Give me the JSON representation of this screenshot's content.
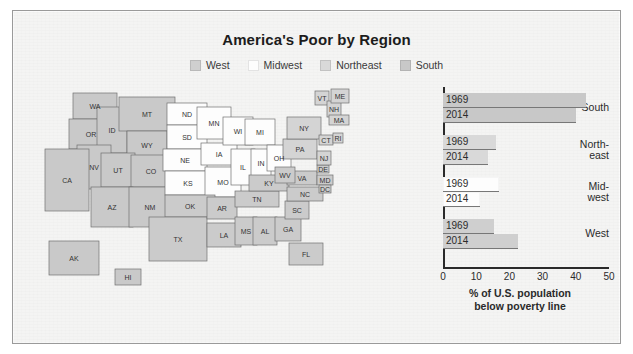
{
  "figure": {
    "title": "America's Poor by Region",
    "frame_color": "#9a9a9a",
    "background": "#f4f4f3"
  },
  "legend": {
    "position": "top-center",
    "items": [
      {
        "label": "West",
        "swatch": "#cfcfcf"
      },
      {
        "label": "Midwest",
        "swatch": "#fdfdfd"
      },
      {
        "label": "Northeast",
        "swatch": "#d9d9d9"
      },
      {
        "label": "South",
        "swatch": "#c8c8c8"
      }
    ]
  },
  "map": {
    "name": "united-states-choropleth",
    "region_colors": {
      "West": "#c9c9c9",
      "Midwest": "#fdfdfd",
      "Northeast": "#d4d4d4",
      "South": "#cbcbcb"
    },
    "ocean": "#f2f2f1",
    "border": "#6f6f6f",
    "states": [
      {
        "abbr": "WA",
        "region": "West",
        "x": 60,
        "y": 22
      },
      {
        "abbr": "OR",
        "region": "West",
        "x": 46,
        "y": 46
      },
      {
        "abbr": "ID",
        "region": "West",
        "x": 80,
        "y": 48
      },
      {
        "abbr": "MT",
        "region": "West",
        "x": 110,
        "y": 27
      },
      {
        "abbr": "WY",
        "region": "West",
        "x": 113,
        "y": 57
      },
      {
        "abbr": "NV",
        "region": "West",
        "x": 55,
        "y": 78
      },
      {
        "abbr": "UT",
        "region": "West",
        "x": 85,
        "y": 82
      },
      {
        "abbr": "CO",
        "region": "West",
        "x": 120,
        "y": 87
      },
      {
        "abbr": "CA",
        "region": "West",
        "x": 30,
        "y": 95
      },
      {
        "abbr": "AZ",
        "region": "West",
        "x": 76,
        "y": 118
      },
      {
        "abbr": "NM",
        "region": "West",
        "x": 113,
        "y": 119
      },
      {
        "abbr": "AK",
        "region": "West",
        "x": 38,
        "y": 175
      },
      {
        "abbr": "HI",
        "region": "West",
        "x": 96,
        "y": 196
      },
      {
        "abbr": "ND",
        "region": "Midwest",
        "x": 153,
        "y": 30
      },
      {
        "abbr": "SD",
        "region": "Midwest",
        "x": 153,
        "y": 52
      },
      {
        "abbr": "NE",
        "region": "Midwest",
        "x": 152,
        "y": 76
      },
      {
        "abbr": "KS",
        "region": "Midwest",
        "x": 155,
        "y": 98
      },
      {
        "abbr": "MN",
        "region": "Midwest",
        "x": 181,
        "y": 38
      },
      {
        "abbr": "IA",
        "region": "Midwest",
        "x": 184,
        "y": 70
      },
      {
        "abbr": "MO",
        "region": "Midwest",
        "x": 190,
        "y": 97
      },
      {
        "abbr": "WI",
        "region": "Midwest",
        "x": 206,
        "y": 48
      },
      {
        "abbr": "IL",
        "region": "Midwest",
        "x": 209,
        "y": 82
      },
      {
        "abbr": "IN",
        "region": "Midwest",
        "x": 228,
        "y": 80
      },
      {
        "abbr": "MI",
        "region": "Midwest",
        "x": 228,
        "y": 52
      },
      {
        "abbr": "OH",
        "region": "Midwest",
        "x": 246,
        "y": 74
      },
      {
        "abbr": "OK",
        "region": "South",
        "x": 157,
        "y": 122
      },
      {
        "abbr": "TX",
        "region": "South",
        "x": 145,
        "y": 152
      },
      {
        "abbr": "AR",
        "region": "South",
        "x": 190,
        "y": 124
      },
      {
        "abbr": "LA",
        "region": "South",
        "x": 192,
        "y": 152
      },
      {
        "abbr": "MS",
        "region": "South",
        "x": 213,
        "y": 143
      },
      {
        "abbr": "AL",
        "region": "South",
        "x": 232,
        "y": 143
      },
      {
        "abbr": "TN",
        "region": "South",
        "x": 224,
        "y": 116
      },
      {
        "abbr": "KY",
        "region": "South",
        "x": 235,
        "y": 100
      },
      {
        "abbr": "GA",
        "region": "South",
        "x": 252,
        "y": 143
      },
      {
        "abbr": "FL",
        "region": "South",
        "x": 272,
        "y": 170
      },
      {
        "abbr": "SC",
        "region": "South",
        "x": 265,
        "y": 127
      },
      {
        "abbr": "NC",
        "region": "South",
        "x": 271,
        "y": 112
      },
      {
        "abbr": "VA",
        "region": "South",
        "x": 270,
        "y": 96
      },
      {
        "abbr": "WV",
        "region": "South",
        "x": 253,
        "y": 92
      },
      {
        "abbr": "MD",
        "region": "South",
        "x": 293,
        "y": 97
      },
      {
        "abbr": "DE",
        "region": "South",
        "x": 293,
        "y": 88
      },
      {
        "abbr": "DC",
        "region": "South",
        "x": 293,
        "y": 106
      },
      {
        "abbr": "PA",
        "region": "Northeast",
        "x": 265,
        "y": 64
      },
      {
        "abbr": "NY",
        "region": "Northeast",
        "x": 272,
        "y": 44
      },
      {
        "abbr": "VT",
        "region": "Northeast",
        "x": 290,
        "y": 16
      },
      {
        "abbr": "NH",
        "region": "Northeast",
        "x": 302,
        "y": 26
      },
      {
        "abbr": "ME",
        "region": "Northeast",
        "x": 308,
        "y": 14
      },
      {
        "abbr": "MA",
        "region": "Northeast",
        "x": 307,
        "y": 38
      },
      {
        "abbr": "CT",
        "region": "Northeast",
        "x": 294,
        "y": 58
      },
      {
        "abbr": "RI",
        "region": "Northeast",
        "x": 307,
        "y": 56
      },
      {
        "abbr": "NJ",
        "region": "Northeast",
        "x": 292,
        "y": 74
      }
    ]
  },
  "chart_data": {
    "type": "bar",
    "orientation": "horizontal",
    "title": "America's Poor by Region",
    "xlabel": "% of U.S. population below poverty line",
    "ylabel": "",
    "xlim": [
      0,
      50
    ],
    "xticks": [
      0,
      10,
      20,
      30,
      40,
      50
    ],
    "grid": false,
    "legend_position": "top-center",
    "groups": [
      {
        "name": "South",
        "label_lines": [
          "South"
        ],
        "color": "#c8c8c8",
        "bars": [
          {
            "year": "1969",
            "value": 43.0
          },
          {
            "year": "2014",
            "value": 40.0
          }
        ]
      },
      {
        "name": "Northeast",
        "label_lines": [
          "North-",
          "east"
        ],
        "color": "#d9d9d9",
        "bars": [
          {
            "year": "1969",
            "value": 16.0
          },
          {
            "year": "2014",
            "value": 13.5
          }
        ]
      },
      {
        "name": "Midwest",
        "label_lines": [
          "Mid-",
          "west"
        ],
        "color": "#fdfdfd",
        "bars": [
          {
            "year": "1969",
            "value": 17.0
          },
          {
            "year": "2014",
            "value": 11.0
          }
        ]
      },
      {
        "name": "West",
        "label_lines": [
          "West"
        ],
        "color": "#cfcfcf",
        "bars": [
          {
            "year": "1969",
            "value": 15.5
          },
          {
            "year": "2014",
            "value": 22.5
          }
        ]
      }
    ]
  },
  "axis_caption": {
    "line1": "% of U.S. population",
    "line2": "below poverty line"
  }
}
